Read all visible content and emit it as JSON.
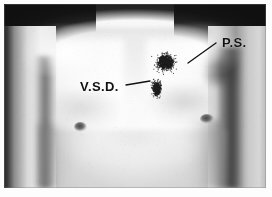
{
  "figure": {
    "kind": "medical-photograph",
    "caption_present": false,
    "background_color": "#ffffff",
    "plate_border_color": "#787878",
    "ink_color": "#111111"
  },
  "annotations": [
    {
      "id": "ps",
      "label": "P.S.",
      "meaning_shown_on_screen": false,
      "label_x": 218,
      "label_y": 31,
      "leader_from_x": 216,
      "leader_from_y": 43,
      "leader_to_x": 188,
      "leader_to_y": 63,
      "marker": {
        "type": "stipple-cloud",
        "center_x": 165,
        "center_y": 62,
        "radius_x": 26,
        "radius_y": 24,
        "dot_count": 520,
        "dot_color": "#1d1d1d",
        "density": "dense-core-diffuse-edge"
      }
    },
    {
      "id": "vsd",
      "label": "V.S.D.",
      "meaning_shown_on_screen": false,
      "label_x": 76,
      "label_y": 75,
      "leader_from_x": 126,
      "leader_from_y": 85,
      "leader_to_x": 150,
      "leader_to_y": 81,
      "marker": {
        "type": "stipple-cloud",
        "center_x": 156,
        "center_y": 88,
        "radius_x": 13,
        "radius_y": 22,
        "dot_count": 300,
        "dot_color": "#1d1d1d",
        "density": "dense-core-diffuse-tail"
      }
    }
  ],
  "anatomy_markers": [
    {
      "name": "nipple-left",
      "x": 76,
      "y": 123
    },
    {
      "name": "nipple-right",
      "x": 203,
      "y": 115
    }
  ],
  "plate": {
    "x": 4,
    "y": 4,
    "width": 262,
    "height": 184
  }
}
